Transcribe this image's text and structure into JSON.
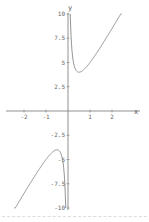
{
  "chart_data": {
    "type": "line",
    "title": "",
    "xlabel": "x",
    "ylabel": "y",
    "xlim": [
      -2.5,
      2.5
    ],
    "ylim": [
      -10,
      10
    ],
    "x_ticks": [
      -2,
      -1,
      1,
      2
    ],
    "x_tick_labels": [
      "-2",
      "-1",
      "1",
      "2"
    ],
    "y_ticks": [
      10,
      7.5,
      5,
      2.5,
      -2.5,
      -5,
      -7.5,
      -10
    ],
    "y_tick_labels": [
      "10",
      "7.5",
      "5",
      "2.5",
      "-2.5",
      "-5",
      "-7.5",
      "-10"
    ],
    "grid": false,
    "legend": null,
    "series": [
      {
        "name": "right branch",
        "x": [
          0.1,
          0.2,
          0.3,
          0.4,
          0.5,
          0.75,
          1.0,
          1.5,
          2.0,
          2.4
        ],
        "y": [
          10.4,
          5.8,
          4.5,
          4.1,
          4.0,
          4.3,
          5.0,
          6.7,
          8.5,
          10.0
        ]
      },
      {
        "name": "left branch",
        "x": [
          -2.4,
          -2.0,
          -1.5,
          -1.0,
          -0.75,
          -0.5,
          -0.4,
          -0.3,
          -0.2,
          -0.1
        ],
        "y": [
          -10.0,
          -8.5,
          -6.7,
          -5.0,
          -4.3,
          -4.0,
          -4.1,
          -4.5,
          -5.8,
          -10.4
        ]
      }
    ],
    "color": "#888888"
  },
  "axes": {
    "x_label": "x",
    "y_label": "y"
  }
}
